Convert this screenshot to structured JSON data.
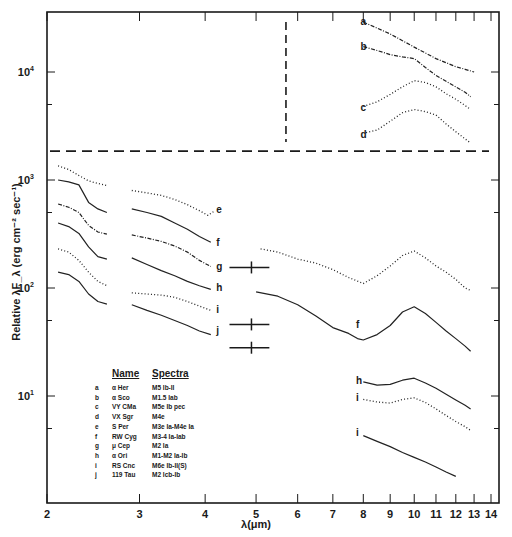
{
  "chart_data": {
    "type": "line",
    "title": "",
    "xlabel": "λ(μm)",
    "ylabel": "Relative λF_λ (erg cm⁻² sec⁻¹)",
    "xscale": "log",
    "yscale": "log",
    "xlim": [
      2,
      14.2
    ],
    "ylim": [
      1.8,
      35000
    ],
    "grid": false,
    "x_ticks": [
      2,
      3,
      4,
      5,
      6,
      7,
      8,
      9,
      10,
      11,
      12,
      13,
      14
    ],
    "y_ticks": [
      {
        "value": 10,
        "label": "10",
        "exp": "1"
      },
      {
        "value": 100,
        "label": "10",
        "exp": "2"
      },
      {
        "value": 1000,
        "label": "10",
        "exp": "3"
      },
      {
        "value": 10000,
        "label": "10",
        "exp": "4"
      }
    ],
    "y_minor_ticks": [
      5,
      50,
      500,
      5000
    ],
    "separators": {
      "horizontal_dashed_y": 1850,
      "vertical_dashed_x": 5.7
    },
    "series": [
      {
        "name": "a",
        "star": "α Her",
        "style": "dotted-solid",
        "label_pos": [
          7.9,
          29000
        ],
        "points": [
          [
            8.0,
            29000
          ],
          [
            8.5,
            25500
          ],
          [
            9.0,
            22500
          ],
          [
            9.5,
            19500
          ],
          [
            10.0,
            17000
          ],
          [
            10.5,
            15000
          ],
          [
            11.0,
            13300
          ],
          [
            11.5,
            12200
          ],
          [
            12.0,
            11200
          ],
          [
            12.5,
            10600
          ],
          [
            13.0,
            10000
          ]
        ]
      },
      {
        "name": "b",
        "star": "α Sco",
        "style": "dotted-solid",
        "label_pos": [
          7.9,
          17000
        ],
        "points": [
          [
            8.0,
            17200
          ],
          [
            8.5,
            15800
          ],
          [
            9.0,
            14500
          ],
          [
            9.5,
            13800
          ],
          [
            10.0,
            13300
          ],
          [
            10.5,
            11000
          ],
          [
            11.0,
            9300
          ],
          [
            11.5,
            8200
          ],
          [
            12.0,
            7300
          ],
          [
            12.5,
            6500
          ],
          [
            12.8,
            5900
          ]
        ]
      },
      {
        "name": "c",
        "star": "VY CMa",
        "style": "dotted",
        "label_pos": [
          7.9,
          4600
        ],
        "points": [
          [
            8.0,
            4800
          ],
          [
            8.5,
            5300
          ],
          [
            9.0,
            6200
          ],
          [
            9.5,
            7300
          ],
          [
            10.0,
            8300
          ],
          [
            10.5,
            8000
          ],
          [
            11.0,
            7300
          ],
          [
            11.5,
            6300
          ],
          [
            12.0,
            5600
          ],
          [
            12.5,
            4900
          ],
          [
            12.8,
            4500
          ]
        ]
      },
      {
        "name": "d",
        "star": "VX Sgr",
        "style": "dotted",
        "label_pos": [
          7.9,
          2600
        ],
        "points": [
          [
            8.1,
            2750
          ],
          [
            8.5,
            2900
          ],
          [
            9.0,
            3500
          ],
          [
            9.5,
            4200
          ],
          [
            10.0,
            4500
          ],
          [
            10.5,
            4300
          ],
          [
            11.0,
            4000
          ],
          [
            11.5,
            3300
          ],
          [
            12.0,
            2800
          ],
          [
            12.5,
            2400
          ],
          [
            12.8,
            2200
          ]
        ]
      },
      {
        "name": "e",
        "star": "S Per",
        "style": "dotted",
        "label_pos": [
          4.2,
          530
        ],
        "segments": [
          [
            [
              2.1,
              1350
            ],
            [
              2.2,
              1250
            ],
            [
              2.3,
              1100
            ],
            [
              2.4,
              980
            ],
            [
              2.5,
              930
            ],
            [
              2.6,
              890
            ]
          ],
          [
            [
              2.9,
              800
            ],
            [
              3.1,
              760
            ],
            [
              3.3,
              720
            ],
            [
              3.5,
              660
            ],
            [
              3.7,
              590
            ],
            [
              3.9,
              520
            ],
            [
              4.05,
              470
            ],
            [
              4.15,
              510
            ]
          ],
          [
            [
              5.1,
              230
            ],
            [
              5.5,
              215
            ],
            [
              6.0,
              185
            ],
            [
              6.5,
              170
            ],
            [
              7.0,
              148
            ],
            [
              7.5,
              125
            ],
            [
              8.0,
              110
            ],
            [
              8.5,
              130
            ],
            [
              9.0,
              160
            ],
            [
              9.5,
              200
            ],
            [
              10.0,
              220
            ],
            [
              10.5,
              190
            ],
            [
              11.0,
              160
            ],
            [
              11.5,
              140
            ],
            [
              12.0,
              120
            ],
            [
              12.5,
              100
            ],
            [
              12.8,
              95
            ]
          ]
        ]
      },
      {
        "name": "f",
        "star": "RW Cyg",
        "style": "solid",
        "label_pos": [
          4.2,
          260
        ],
        "segments": [
          [
            [
              2.1,
              1000
            ],
            [
              2.2,
              960
            ],
            [
              2.3,
              900
            ],
            [
              2.4,
              620
            ],
            [
              2.5,
              540
            ],
            [
              2.6,
              500
            ]
          ],
          [
            [
              2.9,
              540
            ],
            [
              3.1,
              500
            ],
            [
              3.3,
              460
            ],
            [
              3.5,
              400
            ],
            [
              3.7,
              350
            ],
            [
              3.9,
              300
            ],
            [
              4.1,
              265
            ]
          ],
          [
            [
              5.0,
              92
            ],
            [
              5.5,
              84
            ],
            [
              6.0,
              70
            ],
            [
              6.5,
              55
            ],
            [
              7.0,
              43
            ],
            [
              7.5,
              38
            ],
            [
              7.8,
              34
            ],
            [
              8.0,
              33
            ],
            [
              8.5,
              37
            ],
            [
              9.0,
              45
            ],
            [
              9.5,
              60
            ],
            [
              10.0,
              67
            ],
            [
              10.5,
              58
            ],
            [
              11.0,
              48
            ],
            [
              11.5,
              40
            ],
            [
              12.0,
              34
            ],
            [
              12.5,
              29
            ],
            [
              12.8,
              26
            ]
          ]
        ]
      },
      {
        "name": "g",
        "star": "μ Cep",
        "style": "dotted-solid",
        "label_pos": [
          4.2,
          155
        ],
        "segments": [
          [
            [
              2.1,
              600
            ],
            [
              2.2,
              560
            ],
            [
              2.3,
              500
            ],
            [
              2.4,
              380
            ],
            [
              2.5,
              330
            ],
            [
              2.6,
              315
            ]
          ],
          [
            [
              2.9,
              310
            ],
            [
              3.1,
              290
            ],
            [
              3.3,
              270
            ],
            [
              3.5,
              245
            ],
            [
              3.7,
              215
            ],
            [
              3.9,
              180
            ],
            [
              4.1,
              158
            ]
          ]
        ]
      },
      {
        "name": "h",
        "star": "α Ori",
        "style": "solid",
        "label_pos": [
          4.2,
          100
        ],
        "segments": [
          [
            [
              2.1,
              400
            ],
            [
              2.2,
              370
            ],
            [
              2.3,
              320
            ],
            [
              2.4,
              240
            ],
            [
              2.5,
              195
            ],
            [
              2.6,
              185
            ]
          ],
          [
            [
              2.9,
              190
            ],
            [
              3.1,
              165
            ],
            [
              3.3,
              145
            ],
            [
              3.5,
              130
            ],
            [
              3.7,
              115
            ],
            [
              3.9,
              105
            ],
            [
              4.1,
              97
            ]
          ],
          [
            [
              8.0,
              13.5
            ],
            [
              8.5,
              12.6
            ],
            [
              9.0,
              12.8
            ],
            [
              9.5,
              14
            ],
            [
              10.0,
              14.6
            ],
            [
              10.5,
              13.2
            ],
            [
              11.0,
              11.8
            ],
            [
              11.5,
              10.4
            ],
            [
              12.0,
              9.2
            ],
            [
              12.5,
              8.2
            ],
            [
              12.8,
              7.6
            ]
          ]
        ]
      },
      {
        "name": "i",
        "star": "RS Cnc",
        "style": "dotted",
        "label_pos": [
          4.2,
          62
        ],
        "segments": [
          [
            [
              2.1,
              230
            ],
            [
              2.2,
              215
            ],
            [
              2.3,
              180
            ],
            [
              2.4,
              140
            ],
            [
              2.5,
              115
            ],
            [
              2.6,
              105
            ]
          ],
          [
            [
              2.9,
              90
            ],
            [
              3.1,
              88
            ],
            [
              3.3,
              86
            ],
            [
              3.5,
              82
            ],
            [
              3.7,
              75
            ],
            [
              3.9,
              68
            ],
            [
              4.1,
              62
            ]
          ],
          [
            [
              8.0,
              9.3
            ],
            [
              8.5,
              8.8
            ],
            [
              9.0,
              8.6
            ],
            [
              9.5,
              9.3
            ],
            [
              10.0,
              9.6
            ],
            [
              10.5,
              8.7
            ],
            [
              11.0,
              7.6
            ],
            [
              11.5,
              6.6
            ],
            [
              12.0,
              5.8
            ],
            [
              12.5,
              5.2
            ],
            [
              12.8,
              4.8
            ]
          ]
        ]
      },
      {
        "name": "j",
        "star": "119 Tau",
        "style": "solid",
        "label_pos": [
          4.2,
          40
        ],
        "segments": [
          [
            [
              2.1,
              140
            ],
            [
              2.2,
              133
            ],
            [
              2.3,
              115
            ],
            [
              2.4,
              88
            ],
            [
              2.5,
              75
            ],
            [
              2.6,
              71
            ]
          ],
          [
            [
              2.9,
              70
            ],
            [
              3.1,
              62
            ],
            [
              3.3,
              56
            ],
            [
              3.5,
              50
            ],
            [
              3.7,
              45
            ],
            [
              3.9,
              40
            ],
            [
              4.1,
              37
            ]
          ],
          [
            [
              8.0,
              4.3
            ],
            [
              8.5,
              3.8
            ],
            [
              9.0,
              3.4
            ],
            [
              9.5,
              3.0
            ],
            [
              10.0,
              2.7
            ],
            [
              10.5,
              2.45
            ],
            [
              11.0,
              2.2
            ],
            [
              11.5,
              1.98
            ],
            [
              12.0,
              1.8
            ]
          ]
        ]
      }
    ],
    "error_bars": [
      {
        "y": 155,
        "x_from": 4.45,
        "x_to": 5.3,
        "center": 4.9
      },
      {
        "y": 46,
        "x_from": 4.45,
        "x_to": 5.3,
        "center": 4.9
      },
      {
        "y": 28,
        "x_from": 4.45,
        "x_to": 5.3,
        "center": 4.9
      }
    ],
    "extra_labels": [
      {
        "text": "f",
        "x": 7.75,
        "y": 45
      },
      {
        "text": "h",
        "x": 7.75,
        "y": 13.8
      },
      {
        "text": "i",
        "x": 7.75,
        "y": 9.6
      },
      {
        "text": "i",
        "x": 7.75,
        "y": 4.5
      }
    ],
    "legend": {
      "position": "inside-lower-left",
      "headers": {
        "name": "Name",
        "spectra": "Spectra"
      },
      "rows": [
        {
          "key": "a",
          "name": "α Her",
          "spectra": "M5 Ib-II"
        },
        {
          "key": "b",
          "name": "α Sco",
          "spectra": "M1.5 Iab"
        },
        {
          "key": "c",
          "name": "VY CMa",
          "spectra": "M5e Ib pec"
        },
        {
          "key": "d",
          "name": "VX Sgr",
          "spectra": "M4e"
        },
        {
          "key": "e",
          "name": "S Per",
          "spectra": "M3e Ia-M4e Ia"
        },
        {
          "key": "f",
          "name": "RW Cyg",
          "spectra": "M3-4 Ia-Iab"
        },
        {
          "key": "g",
          "name": "μ Cep",
          "spectra": "M2 Ia"
        },
        {
          "key": "h",
          "name": "α Ori",
          "spectra": "M1-M2 Ia-Ib"
        },
        {
          "key": "i",
          "name": "RS Cnc",
          "spectra": "M6e Ib-II(S)"
        },
        {
          "key": "j",
          "name": "119 Tau",
          "spectra": "M2 Icb-Ib"
        }
      ]
    }
  }
}
